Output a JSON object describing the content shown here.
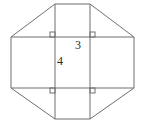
{
  "figure": {
    "stroke_color": "#6f6f6f",
    "background_color": "#ffffff",
    "label_color": "#2b2b2b",
    "width": 142,
    "height": 129,
    "octagon_points": "55,4 90,4 134,37 134,88 90,119 55,119 11,88 11,37",
    "inner_lines": [
      {
        "x1": 55,
        "y1": 4,
        "x2": 55,
        "y2": 119
      },
      {
        "x1": 90,
        "y1": 4,
        "x2": 90,
        "y2": 119
      },
      {
        "x1": 11,
        "y1": 37,
        "x2": 134,
        "y2": 37
      },
      {
        "x1": 11,
        "y1": 88,
        "x2": 134,
        "y2": 88
      }
    ],
    "right_angle_marks": [
      {
        "x": 50,
        "y": 32,
        "size": 5
      },
      {
        "x": 90,
        "y": 32,
        "size": 5
      },
      {
        "x": 50,
        "y": 88,
        "size": 5
      },
      {
        "x": 90,
        "y": 88,
        "size": 5
      }
    ],
    "labels": [
      {
        "text": "3",
        "x": 78,
        "y": 45
      },
      {
        "text": "4",
        "x": 60,
        "y": 61
      }
    ]
  }
}
